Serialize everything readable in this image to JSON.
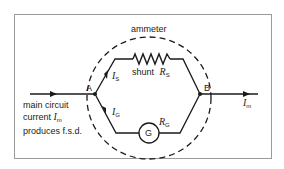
{
  "diagram": {
    "title_label": "ammeter",
    "nodes": {
      "a": "A",
      "b": "B"
    },
    "shunt": {
      "label": "shunt",
      "symbol": "R",
      "subscript": "S"
    },
    "galvanometer": {
      "symbol": "G",
      "resistance_symbol": "R",
      "resistance_subscript": "G"
    },
    "currents": {
      "shunt": {
        "symbol": "I",
        "subscript": "S"
      },
      "galvo": {
        "symbol": "I",
        "subscript": "G"
      },
      "main_out": {
        "symbol": "I",
        "subscript": "m"
      }
    },
    "main_caption": {
      "line1": "main circuit",
      "line2_prefix": "current ",
      "line2_symbol": "I",
      "line2_subscript": "m",
      "line3": "produces f.s.d."
    },
    "colors": {
      "line": "#1a1a1a",
      "frame": "#9a9a9a",
      "background": "#ffffff"
    }
  }
}
